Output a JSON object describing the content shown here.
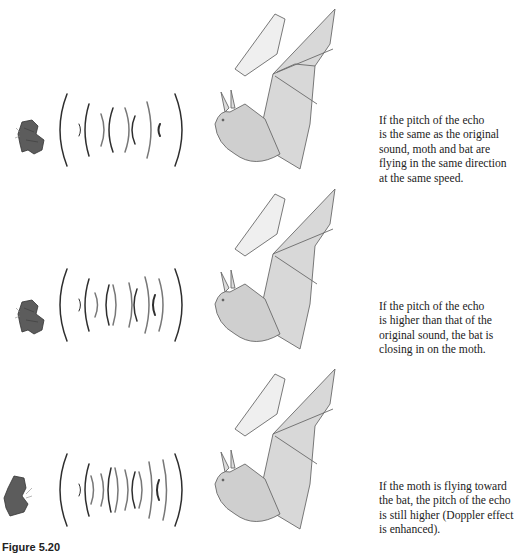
{
  "figure": {
    "label": "Figure 5.20",
    "panels": [
      {
        "id": "same-pitch",
        "moth_icon": "moth-icon",
        "bat_icon": "bat-icon",
        "description_lines": [
          "If the pitch of the echo",
          "is the same as the original",
          "sound, moth and bat are",
          "flying in the same direction",
          "at the same speed."
        ]
      },
      {
        "id": "higher-pitch",
        "moth_icon": "moth-icon",
        "bat_icon": "bat-icon",
        "description_lines": [
          "If the pitch of the echo",
          "is higher than that of the",
          "original sound, the bat is",
          "closing in on the moth."
        ]
      },
      {
        "id": "still-higher-pitch",
        "moth_icon": "moth-icon",
        "bat_icon": "bat-icon",
        "description_lines": [
          "If the moth is flying toward",
          "the bat, the pitch of the echo",
          "is still higher (Doppler effect",
          "is enhanced)."
        ]
      }
    ]
  },
  "colors": {
    "ink": "#222222",
    "moth": "#5a5a5a",
    "bat_shade": "#b8b8b8",
    "wave": "#3a3a3a",
    "background": "#ffffff"
  }
}
